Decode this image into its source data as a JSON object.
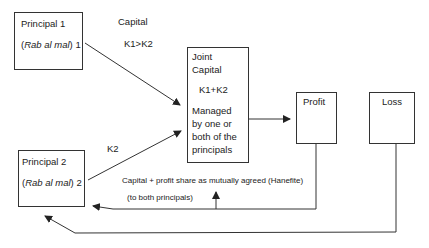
{
  "diagram": {
    "type": "mudaraba-flow",
    "nodes": {
      "principal1": {
        "title": "Principal 1",
        "sub_pre": "(",
        "sub_italic": "Rab al mal",
        "sub_post": ") 1"
      },
      "principal2": {
        "title": "Principal 2",
        "sub_pre": "(",
        "sub_italic": "Rab al mal",
        "sub_post": ") 2"
      },
      "joint": {
        "line1": "Joint",
        "line2": "Capital",
        "formula": "K1+K2",
        "desc1": "Managed",
        "desc2": "by one or",
        "desc3": "both of the",
        "desc4": "principals"
      },
      "profit": {
        "label": "Profit"
      },
      "loss": {
        "label": "Loss"
      }
    },
    "labels": {
      "capital": "Capital",
      "k1_gt_k2": "K1>K2",
      "k2": "K2",
      "share_note": "Capital + profit share as mutually agreed (Hanefite)",
      "to_both": "(to both principals)"
    },
    "edges": [
      {
        "from": "principal1",
        "to": "joint",
        "label": "Capital K1>K2"
      },
      {
        "from": "principal2",
        "to": "joint",
        "label": "K2"
      },
      {
        "from": "joint",
        "to": "profit"
      },
      {
        "from": "profit",
        "to": "principal2",
        "label": "Capital + profit share as mutually agreed (Hanefite)"
      },
      {
        "from": "profit",
        "to": "principal1",
        "label": "(to both principals)"
      },
      {
        "from": "loss",
        "to": "principal2"
      }
    ],
    "colors": {
      "line": "#333333",
      "text": "#222222",
      "background": "#ffffff"
    }
  }
}
